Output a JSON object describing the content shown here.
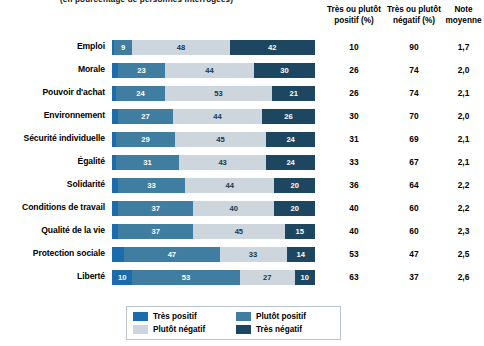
{
  "title_partial": "(en pourcentage de personnes interrogées)",
  "columns": {
    "positive_header": "Très ou plutôt positif (%)",
    "negative_header": "Très ou plutôt négatif (%)",
    "average_header": "Note moyenne"
  },
  "legend": {
    "items": [
      {
        "key": "tp",
        "label": "Très positif",
        "color": "#1b6cac"
      },
      {
        "key": "pp",
        "label": "Plutôt positif",
        "color": "#3f7da1"
      },
      {
        "key": "pn",
        "label": "Plutôt négatif",
        "color": "#cdd6dd"
      },
      {
        "key": "tn",
        "label": "Très négatif",
        "color": "#1d4760"
      }
    ]
  },
  "chart_data": {
    "type": "bar",
    "title": "(en pourcentage de personnes interrogées)",
    "xlabel": "",
    "ylabel": "",
    "xlim": [
      0,
      100
    ],
    "grid": false,
    "orientation": "horizontal",
    "stacked": true,
    "legend_position": "bottom",
    "categories": [
      "Emploi",
      "Morale",
      "Pouvoir d'achat",
      "Environnement",
      "Sécurité individuelle",
      "Égalité",
      "Solidarité",
      "Conditions de travail",
      "Qualité de la vie",
      "Protection sociale",
      "Liberté"
    ],
    "series": [
      {
        "name": "Très positif",
        "key": "tp",
        "color": "#1b6cac",
        "values": [
          1,
          3,
          2,
          3,
          2,
          2,
          3,
          3,
          3,
          6,
          10
        ]
      },
      {
        "name": "Plutôt positif",
        "key": "pp",
        "color": "#3f7da1",
        "values": [
          9,
          23,
          24,
          27,
          29,
          31,
          33,
          37,
          37,
          47,
          53
        ]
      },
      {
        "name": "Plutôt négatif",
        "key": "pn",
        "color": "#cdd6dd",
        "values": [
          48,
          44,
          53,
          44,
          45,
          43,
          44,
          40,
          45,
          33,
          27
        ]
      },
      {
        "name": "Très négatif",
        "key": "tn",
        "color": "#1d4760",
        "values": [
          42,
          30,
          21,
          26,
          24,
          24,
          20,
          20,
          15,
          14,
          10
        ]
      }
    ],
    "rows": [
      {
        "label": "Emploi",
        "tp": 1,
        "pp": 9,
        "pn": 48,
        "tn": 42,
        "positive": 10,
        "negative": 90,
        "average": "1,7"
      },
      {
        "label": "Morale",
        "tp": 3,
        "pp": 23,
        "pn": 44,
        "tn": 30,
        "positive": 26,
        "negative": 74,
        "average": "2,0"
      },
      {
        "label": "Pouvoir d'achat",
        "tp": 2,
        "pp": 24,
        "pn": 53,
        "tn": 21,
        "positive": 26,
        "negative": 74,
        "average": "2,1"
      },
      {
        "label": "Environnement",
        "tp": 3,
        "pp": 27,
        "pn": 44,
        "tn": 26,
        "positive": 30,
        "negative": 70,
        "average": "2,0"
      },
      {
        "label": "Sécurité individuelle",
        "tp": 2,
        "pp": 29,
        "pn": 45,
        "tn": 24,
        "positive": 31,
        "negative": 69,
        "average": "2,1"
      },
      {
        "label": "Égalité",
        "tp": 2,
        "pp": 31,
        "pn": 43,
        "tn": 24,
        "positive": 33,
        "negative": 67,
        "average": "2,1"
      },
      {
        "label": "Solidarité",
        "tp": 3,
        "pp": 33,
        "pn": 44,
        "tn": 20,
        "positive": 36,
        "negative": 64,
        "average": "2,2"
      },
      {
        "label": "Conditions de travail",
        "tp": 3,
        "pp": 37,
        "pn": 40,
        "tn": 20,
        "positive": 40,
        "negative": 60,
        "average": "2,2"
      },
      {
        "label": "Qualité de la vie",
        "tp": 3,
        "pp": 37,
        "pn": 45,
        "tn": 15,
        "positive": 40,
        "negative": 60,
        "average": "2,3"
      },
      {
        "label": "Protection sociale",
        "tp": 6,
        "pp": 47,
        "pn": 33,
        "tn": 14,
        "positive": 53,
        "negative": 47,
        "average": "2,5"
      },
      {
        "label": "Liberté",
        "tp": 10,
        "pp": 53,
        "pn": 27,
        "tn": 10,
        "positive": 63,
        "negative": 37,
        "average": "2,6"
      }
    ]
  }
}
